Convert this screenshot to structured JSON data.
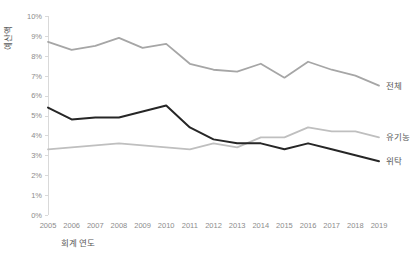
{
  "chart_data": {
    "type": "line",
    "title": "",
    "subtitle": "",
    "xlabel": "회계 연도",
    "ylabel": "예산액",
    "grid": false,
    "legend_position": "right-inline",
    "categories": [
      "2005",
      "2006",
      "2007",
      "2008",
      "2009",
      "2010",
      "2011",
      "2012",
      "2013",
      "2014",
      "2015",
      "2016",
      "2017",
      "2018",
      "2019"
    ],
    "x": [
      2005,
      2006,
      2007,
      2008,
      2009,
      2010,
      2011,
      2012,
      2013,
      2014,
      2015,
      2016,
      2017,
      2018,
      2019
    ],
    "xlim": [
      2005,
      2019
    ],
    "ylim": [
      0,
      10
    ],
    "ytick_labels": [
      "10%",
      "9%",
      "8%",
      "7%",
      "6%",
      "5%",
      "4%",
      "3%",
      "2%",
      "1%",
      "0%"
    ],
    "ytick_values": [
      10,
      9,
      8,
      7,
      6,
      5,
      4,
      3,
      2,
      1,
      0
    ],
    "yunit": "%",
    "series": [
      {
        "name": "전체",
        "color": "#a6a6a6",
        "width": 1.8,
        "values": [
          8.7,
          8.3,
          8.5,
          8.9,
          8.4,
          8.6,
          7.6,
          7.3,
          7.2,
          7.6,
          6.9,
          7.7,
          7.3,
          7.0,
          6.5
        ]
      },
      {
        "name": "유기농",
        "color": "#bfbfbf",
        "width": 1.8,
        "values": [
          3.3,
          3.4,
          3.5,
          3.6,
          3.5,
          3.4,
          3.3,
          3.6,
          3.4,
          3.9,
          3.9,
          4.4,
          4.2,
          4.2,
          3.9
        ]
      },
      {
        "name": "위탁",
        "color": "#262626",
        "width": 2.0,
        "values": [
          5.4,
          4.8,
          4.9,
          4.9,
          5.2,
          5.5,
          4.4,
          3.8,
          3.6,
          3.6,
          3.3,
          3.6,
          3.3,
          3.0,
          2.7
        ]
      }
    ]
  },
  "axes": {
    "y_title": "예산액",
    "x_title": "회계 연도"
  },
  "legend": {
    "items": [
      {
        "label": "전체",
        "color": "#a6a6a6"
      },
      {
        "label": "유기농",
        "color": "#bfbfbf"
      },
      {
        "label": "위탁",
        "color": "#262626"
      }
    ]
  }
}
